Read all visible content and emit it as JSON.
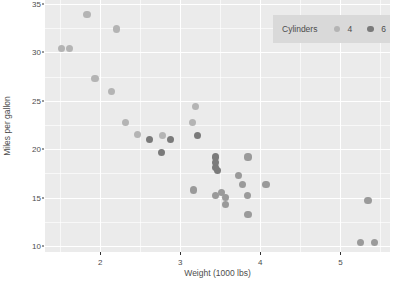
{
  "chart_data": {
    "type": "scatter",
    "title": "",
    "xlabel": "Weight (1000 lbs)",
    "ylabel": "Miles per gallon",
    "xlim": [
      1.31,
      5.62
    ],
    "ylim": [
      9.4,
      35.4
    ],
    "xticks": [
      "2",
      "3",
      "4",
      "5"
    ],
    "xtick_values": [
      2,
      3,
      4,
      5
    ],
    "yticks": [
      "10",
      "15",
      "20",
      "25",
      "30",
      "35"
    ],
    "ytick_values": [
      10,
      15,
      20,
      25,
      30,
      35
    ],
    "x_minor_values": [
      1.5,
      2.5,
      3.5,
      4.5,
      5.5
    ],
    "y_minor_values": [
      12.5,
      17.5,
      22.5,
      27.5,
      32.5
    ],
    "grid": true,
    "legend": {
      "title": "Cylinders",
      "position": "top-right",
      "entries": [
        {
          "label": "4",
          "color": "#b4b4b4"
        },
        {
          "label": "6",
          "color": "#7a7a7a"
        },
        {
          "label": "8",
          "color": "#9a9a9a"
        }
      ]
    },
    "series": [
      {
        "name": "4",
        "color": "#b4b4b4",
        "points": [
          {
            "x": 1.513,
            "y": 30.4
          },
          {
            "x": 1.615,
            "y": 30.4
          },
          {
            "x": 1.835,
            "y": 33.9
          },
          {
            "x": 1.935,
            "y": 27.3
          },
          {
            "x": 2.14,
            "y": 26.0
          },
          {
            "x": 2.2,
            "y": 32.4
          },
          {
            "x": 2.32,
            "y": 22.8
          },
          {
            "x": 2.465,
            "y": 21.5
          },
          {
            "x": 2.78,
            "y": 21.4
          },
          {
            "x": 3.15,
            "y": 22.8
          },
          {
            "x": 3.19,
            "y": 24.4
          }
        ]
      },
      {
        "name": "6",
        "color": "#7a7a7a",
        "points": [
          {
            "x": 2.62,
            "y": 21.0
          },
          {
            "x": 2.875,
            "y": 21.0
          },
          {
            "x": 2.77,
            "y": 19.7
          },
          {
            "x": 3.215,
            "y": 21.4
          },
          {
            "x": 3.44,
            "y": 19.2
          },
          {
            "x": 3.44,
            "y": 18.1
          },
          {
            "x": 3.46,
            "y": 17.8
          },
          {
            "x": 3.44,
            "y": 18.6
          }
        ]
      },
      {
        "name": "8",
        "color": "#9a9a9a",
        "points": [
          {
            "x": 3.17,
            "y": 15.8
          },
          {
            "x": 3.435,
            "y": 15.2
          },
          {
            "x": 3.52,
            "y": 15.5
          },
          {
            "x": 3.57,
            "y": 14.3
          },
          {
            "x": 3.57,
            "y": 15.0
          },
          {
            "x": 3.73,
            "y": 17.3
          },
          {
            "x": 3.78,
            "y": 16.4
          },
          {
            "x": 3.84,
            "y": 15.2
          },
          {
            "x": 3.845,
            "y": 19.2
          },
          {
            "x": 3.845,
            "y": 13.3
          },
          {
            "x": 4.07,
            "y": 16.4
          },
          {
            "x": 5.25,
            "y": 10.4
          },
          {
            "x": 5.345,
            "y": 14.7
          },
          {
            "x": 5.424,
            "y": 10.4
          }
        ]
      }
    ]
  }
}
